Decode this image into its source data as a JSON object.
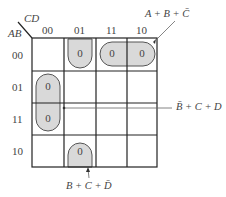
{
  "kmap": {
    "col_var": "CD",
    "row_var": "AB",
    "col_headers": [
      "00",
      "01",
      "11",
      "10"
    ],
    "row_headers": [
      "00",
      "01",
      "11",
      "10"
    ],
    "cells": [
      {
        "row": "00",
        "col": "01",
        "value": "0"
      },
      {
        "row": "00",
        "col": "11",
        "value": "0"
      },
      {
        "row": "00",
        "col": "10",
        "value": "0"
      },
      {
        "row": "01",
        "col": "00",
        "value": "0"
      },
      {
        "row": "11",
        "col": "00",
        "value": "0"
      },
      {
        "row": "10",
        "col": "01",
        "value": "0"
      }
    ],
    "groups": [
      {
        "term": "A + B + C̄"
      },
      {
        "term": "B̄ + C + D"
      },
      {
        "term": "B + C + D̄"
      }
    ]
  },
  "colors": {
    "grid": "#222222",
    "group_fill": "#d9d9d9",
    "group_stroke": "#555555"
  }
}
